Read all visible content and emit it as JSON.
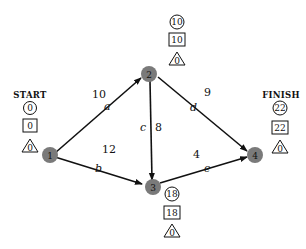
{
  "diagram": {
    "type": "activity-network",
    "start_label": "START",
    "finish_label": "FINISH",
    "nodes": [
      {
        "id": "1",
        "label": "1",
        "earliest": "0",
        "latest": "0",
        "slack": "0"
      },
      {
        "id": "2",
        "label": "2",
        "earliest": "10",
        "latest": "10",
        "slack": "0"
      },
      {
        "id": "3",
        "label": "3",
        "earliest": "18",
        "latest": "18",
        "slack": "0"
      },
      {
        "id": "4",
        "label": "4",
        "earliest": "22",
        "latest": "22",
        "slack": "0"
      }
    ],
    "edges": [
      {
        "from": "1",
        "to": "2",
        "activity": "a",
        "duration": "10"
      },
      {
        "from": "1",
        "to": "3",
        "activity": "b",
        "duration": "12"
      },
      {
        "from": "2",
        "to": "3",
        "activity": "c",
        "duration": "8"
      },
      {
        "from": "2",
        "to": "4",
        "activity": "d",
        "duration": "9"
      },
      {
        "from": "3",
        "to": "4",
        "activity": "e",
        "duration": "4"
      }
    ],
    "colors": {
      "node_fill": "#7a7a7a",
      "edge": "#111111"
    }
  }
}
